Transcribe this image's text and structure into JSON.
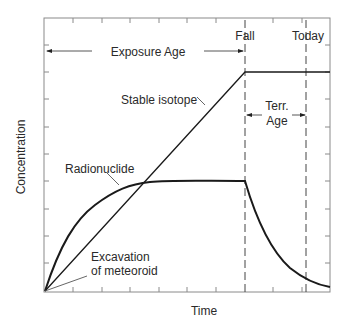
{
  "diagram": {
    "type": "concept-plot",
    "x_axis_label": "Time",
    "y_axis_label": "Concentration",
    "event_labels": {
      "fall": "Fall",
      "today": "Today"
    },
    "spans": {
      "exposure_age": "Exposure Age",
      "terr_age_line1": "Terr.",
      "terr_age_line2": "Age"
    },
    "curve_labels": {
      "stable_isotope": "Stable isotope",
      "radionuclide": "Radionuclide",
      "excavation_line1": "Excavation",
      "excavation_line2": "of meteoroid"
    },
    "colors": {
      "line": "#1a1a1a",
      "frame": "#888888",
      "text": "#2a2a2a"
    }
  }
}
